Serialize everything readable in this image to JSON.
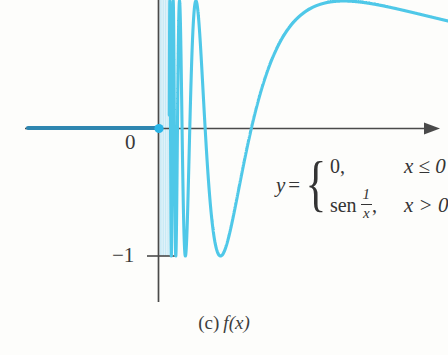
{
  "figure": {
    "caption_prefix": "(c)",
    "caption_function": "f(x)",
    "background_color": "#fdfdfb"
  },
  "axes": {
    "x_axis_label": "",
    "y_axis_label": "",
    "origin_label": "0",
    "tick_negative_one_label": "−1",
    "axis_color": "#4a4a4a",
    "origin_dot_color": "#29b6e8"
  },
  "equation": {
    "lhs": "y",
    "equals": "=",
    "brace": "{",
    "case_one_value": "0,",
    "case_one_condition": "x ≤ 0",
    "case_two_function": "sen",
    "case_two_numerator": "1",
    "case_two_denominator": "x",
    "case_two_comma": ",",
    "case_two_condition": "x > 0"
  },
  "colors": {
    "curve_cyan": "#4fc8e8",
    "ray_blue": "#2e86b0",
    "haze_cyan": "#d8f0f8"
  },
  "chart_data": {
    "type": "line",
    "xlabel": "x",
    "ylabel": "y",
    "xlim": [
      -1.3,
      2.6
    ],
    "ylim": [
      -1.45,
      1.5
    ],
    "grid": false,
    "legend": null,
    "function_definition": "f(x) = 0 for x <= 0 ; sen(1/x) for x > 0",
    "series": [
      {
        "name": "y = 0, x ≤ 0",
        "style": "thick solid ray",
        "color": "#2e86b0",
        "x": [
          -1.3,
          0
        ],
        "values": [
          0,
          0
        ]
      },
      {
        "name": "y = sen(1/x), x > 0",
        "style": "solid curve",
        "color": "#4fc8e8",
        "description": "Oscillates infinitely between -1 and 1 as x approaches 0 from the right; period lengthens as x increases; crosses zero at x = 1/(k*pi); last visible zero crossing near x = 1/pi then rises toward 1.",
        "x_min": 0,
        "x_max": 2.6,
        "amplitude_max": 1,
        "amplitude_min": -1,
        "zero_crossings": [
          0.3183,
          0.1592,
          0.1061,
          0.0796,
          0.0637,
          0.0531
        ],
        "minima_x": [
          0.2122,
          0.0909,
          0.0579,
          0.0425
        ],
        "minima_y": [
          -1,
          -1,
          -1,
          -1
        ],
        "maxima_x": [
          0.4547,
          0.1273,
          0.0735,
          0.0518
        ],
        "maxima_y": [
          1,
          1,
          1,
          1
        ]
      }
    ],
    "annotations": [
      {
        "text": "0",
        "x": -0.13,
        "y": -0.12,
        "role": "origin-label"
      },
      {
        "text": "−1",
        "x": -0.28,
        "y": -1,
        "role": "y-tick-label"
      },
      {
        "text": "y = { 0, x ≤ 0 ; sen 1/x, x > 0 }",
        "x": 1.0,
        "y": -0.35,
        "role": "equation"
      }
    ]
  }
}
